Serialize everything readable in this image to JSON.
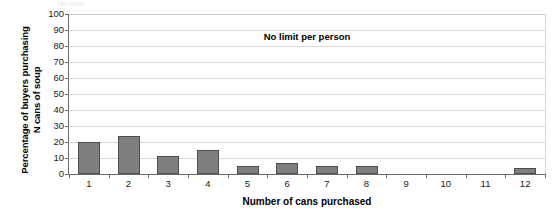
{
  "chart_data": {
    "type": "bar",
    "title": "",
    "annotation": "No limit per person",
    "xlabel": "Number of cans purchased",
    "ylabel_line1": "Percentage of buyers purchasing",
    "ylabel_line2": "N cans of soup",
    "categories": [
      "1",
      "2",
      "3",
      "4",
      "5",
      "6",
      "7",
      "8",
      "9",
      "10",
      "11",
      "12"
    ],
    "values": [
      20,
      24,
      11,
      15,
      5,
      7,
      5,
      5,
      0,
      0,
      0,
      4
    ],
    "ylim": [
      0,
      100
    ],
    "yticks": [
      0,
      10,
      20,
      30,
      40,
      50,
      60,
      70,
      80,
      90,
      100
    ],
    "ytick_labels": [
      "0",
      "10",
      "20",
      "30",
      "40",
      "50",
      "60",
      "70",
      "80",
      "90",
      "100"
    ],
    "grid": true,
    "legend": "none",
    "bar_color": "#7f7f7f",
    "bar_edge_color": "#4d4d4d",
    "grid_color": "#d9d9d9",
    "axis_color": "#6b6b6b"
  },
  "clipped_header_text": "No limit"
}
